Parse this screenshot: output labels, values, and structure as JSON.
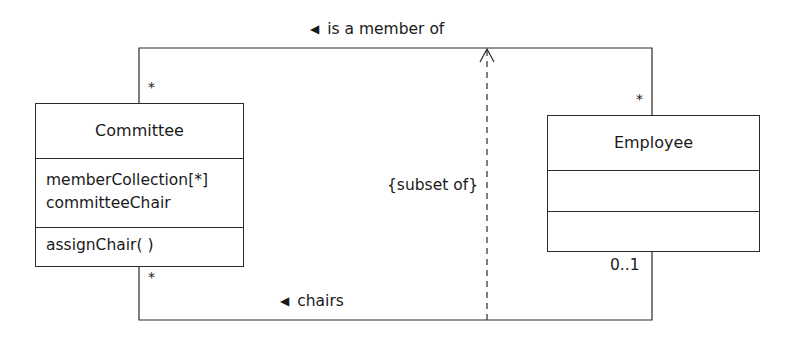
{
  "diagram": {
    "type": "UML class diagram",
    "classes": [
      {
        "id": "committee",
        "name": "Committee",
        "attributes": [
          "memberCollection[*]",
          "committeeChair"
        ],
        "operations": [
          "assignChair( )"
        ]
      },
      {
        "id": "employee",
        "name": "Employee",
        "attributes": [],
        "operations": []
      }
    ],
    "associations": [
      {
        "id": "member-of",
        "direction_glyph": "◀",
        "label": "is a member of",
        "committee_end_multiplicity": "*",
        "employee_end_multiplicity": "*"
      },
      {
        "id": "chairs",
        "direction_glyph": "◀",
        "label": "chairs",
        "committee_end_multiplicity": "*",
        "employee_end_multiplicity": "0..1"
      }
    ],
    "constraint": {
      "label": "{subset of}",
      "from": "chairs",
      "to": "member-of",
      "style": "dashed-arrow"
    },
    "colors": {
      "line": "#2a2a2a",
      "background": "#ffffff",
      "text": "#1a1a1a"
    }
  }
}
